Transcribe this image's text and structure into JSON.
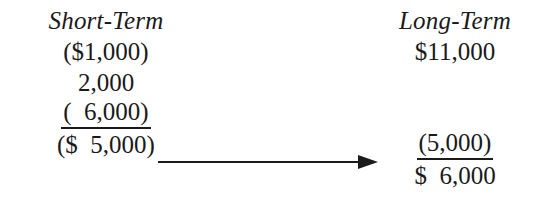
{
  "figure": {
    "type": "capital-gain-loss-netting",
    "columns": [
      {
        "heading": "Short-Term",
        "rows": [
          {
            "text": "($1,000)",
            "ruled": false
          },
          {
            "text": "2,000",
            "ruled": false
          },
          {
            "text": "(  6,000)",
            "ruled": true
          },
          {
            "text": "($  5,000)",
            "ruled": false
          }
        ]
      },
      {
        "heading": "Long-Term",
        "rows": [
          {
            "text": "$11,000",
            "ruled": false
          },
          {
            "text": "(5,000)",
            "ruled": true
          },
          {
            "text": "$  6,000",
            "ruled": false
          }
        ]
      }
    ],
    "arrow": {
      "name": "netting-arrow",
      "direction": "right",
      "from_value": "($  5,000)",
      "to_value": "(5,000)"
    },
    "colors": {
      "ink": "#1a1a1a",
      "background": "#ffffff"
    }
  }
}
